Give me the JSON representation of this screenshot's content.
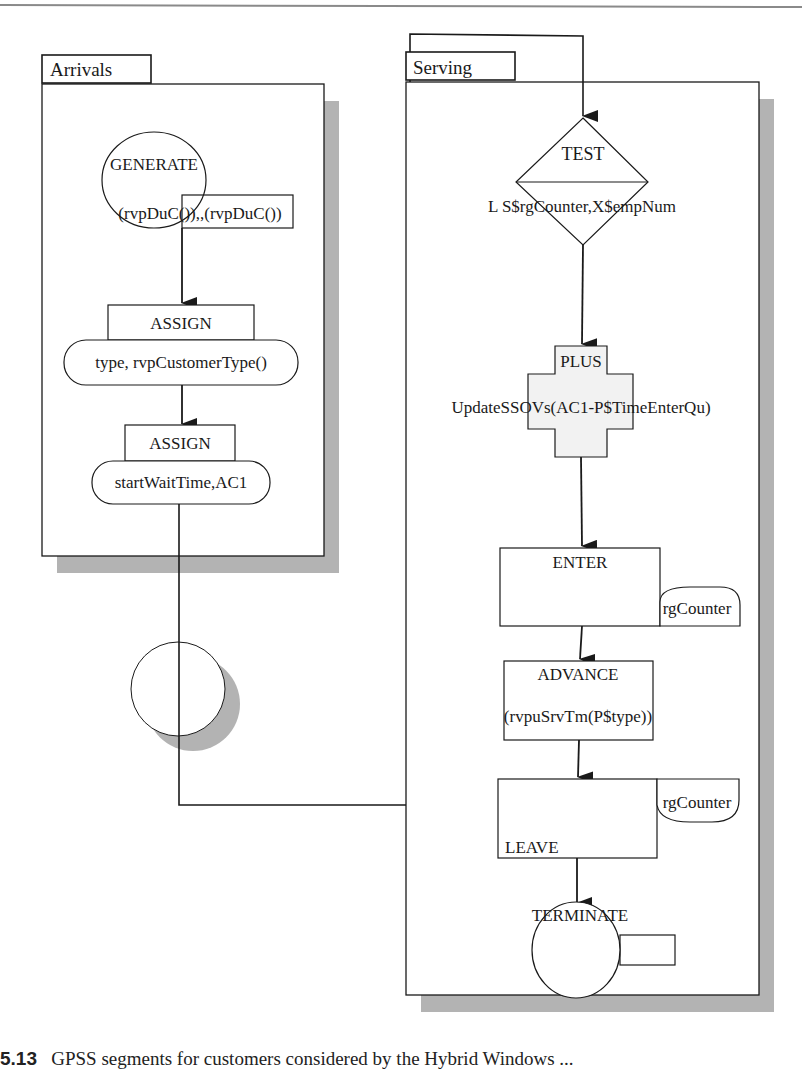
{
  "figure": {
    "colors": {
      "line": "#1a1a1a",
      "shadow": "#b3b3b3",
      "rule": "#8a8a8a",
      "plus_fill": "#f2f2f2",
      "background": "#ffffff"
    }
  },
  "segments": [
    {
      "name": "Arrivals",
      "blocks": [
        {
          "type": "GENERATE",
          "label": "GENERATE",
          "operand": "(rvpDuC()),,(rvpDuC())"
        },
        {
          "type": "ASSIGN",
          "label": "ASSIGN",
          "operand": "type, rvpCustomerType()"
        },
        {
          "type": "ASSIGN",
          "label": "ASSIGN",
          "operand": "startWaitTime,AC1"
        },
        {
          "type": "CONNECTOR",
          "label": ""
        }
      ]
    },
    {
      "name": "Serving",
      "blocks": [
        {
          "type": "TEST",
          "label": "TEST",
          "operand": "L S$rgCounter,X$empNum"
        },
        {
          "type": "PLUS",
          "label": "PLUS",
          "operand": "UpdateSSOVs(AC1-P$TimeEnterQu)"
        },
        {
          "type": "ENTER",
          "label": "ENTER",
          "operand": "rgCounter"
        },
        {
          "type": "ADVANCE",
          "label": "ADVANCE",
          "operand": "(rvpuSrvTm(P$type))"
        },
        {
          "type": "LEAVE",
          "label": "LEAVE",
          "operand": "rgCounter"
        },
        {
          "type": "TERMINATE",
          "label": "TERMINATE",
          "operand": ""
        }
      ]
    }
  ],
  "caption": {
    "number": "5.13",
    "text": "GPSS segments for customers considered by the Hybrid Windows ..."
  }
}
